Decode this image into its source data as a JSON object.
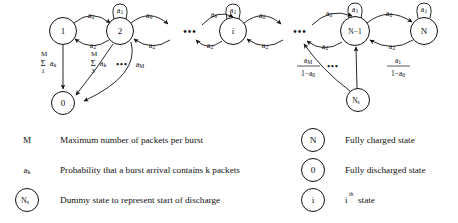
{
  "diagram": {
    "states": [
      {
        "id": "s1",
        "label": "1",
        "cx": 63,
        "cy": 31,
        "r": 13.5
      },
      {
        "id": "s2",
        "label": "2",
        "cx": 120,
        "cy": 31,
        "r": 13.5
      },
      {
        "id": "si",
        "label": "i",
        "cx": 233,
        "cy": 31,
        "r": 13.5
      },
      {
        "id": "sNm1",
        "label": "N−1",
        "cx": 355,
        "cy": 31,
        "r": 14.5
      },
      {
        "id": "sN",
        "label": "N",
        "cx": 424,
        "cy": 31,
        "r": 13.5
      },
      {
        "id": "s0",
        "label": "0",
        "cx": 63,
        "cy": 103,
        "r": 11.5
      },
      {
        "id": "sNs",
        "label": "Ns",
        "cx": 358,
        "cy": 100,
        "r": 11.5
      }
    ],
    "edge_labels": {
      "a0": "a",
      "a0_sub": "0",
      "a1": "a",
      "a1_sub": "1",
      "a2": "a",
      "a2_sub": "2",
      "aM": "a",
      "aM_sub": "M",
      "ak": "a",
      "ak_sub": "k",
      "sum_upper": "M",
      "sum_symbol": "Σ",
      "sum_lower_1": "1",
      "sum_lower_3": "3",
      "one_minus": "1−a",
      "one_minus_sub": "0"
    },
    "ellipses": [
      "•••",
      "•••",
      "•••",
      "•••"
    ],
    "transitions": [
      {
        "from": "1",
        "to": "2",
        "label": "a0"
      },
      {
        "from": "2",
        "to": "1",
        "label": "a2"
      },
      {
        "from": "2",
        "to": "2",
        "label": "a1"
      },
      {
        "from": "2",
        "to": "next",
        "label": "a0"
      },
      {
        "from": "next",
        "to": "2",
        "label": "a2"
      },
      {
        "from": "prev",
        "to": "i",
        "label": "a0"
      },
      {
        "from": "i",
        "to": "prev",
        "label": "a2"
      },
      {
        "from": "i",
        "to": "i",
        "label": "a1"
      },
      {
        "from": "i",
        "to": "next2",
        "label": "a0"
      },
      {
        "from": "next2",
        "to": "i",
        "label": "a2"
      },
      {
        "from": "prev2",
        "to": "N-1",
        "label": "a0"
      },
      {
        "from": "N-1",
        "to": "prev2",
        "label": "a2"
      },
      {
        "from": "N-1",
        "to": "N-1",
        "label": "a1"
      },
      {
        "from": "N-1",
        "to": "N",
        "label": "a0"
      },
      {
        "from": "N",
        "to": "N-1",
        "label": "a2"
      },
      {
        "from": "N",
        "to": "N",
        "label": "a1"
      },
      {
        "from": "1",
        "to": "0",
        "label": "sum_M_1_ak"
      },
      {
        "from": "2",
        "to": "0",
        "label": "sum_M_3_ak"
      },
      {
        "from": "2",
        "to": "0",
        "label": "aM"
      },
      {
        "from": "Ns",
        "to": "N-1",
        "label": "a1_over_1_minus_a0"
      },
      {
        "from": "Ns",
        "to": "mid",
        "label": "aM_over_1_minus_a0"
      }
    ]
  },
  "legend": {
    "left": [
      {
        "key": "M",
        "key_sub": "",
        "key_type": "text",
        "desc": "Maximum number of packets per burst"
      },
      {
        "key": "a",
        "key_sub": "k",
        "key_type": "text",
        "desc": "Probability that a burst arrival contains k packets"
      },
      {
        "key": "N",
        "key_sub": "s",
        "key_type": "circle",
        "desc": "Dummy state to represent start of discharge"
      }
    ],
    "right": [
      {
        "key": "N",
        "key_sub": "",
        "key_type": "circle",
        "desc": "Fully charged state"
      },
      {
        "key": "0",
        "key_sub": "",
        "key_type": "circle",
        "desc": "Fully discharged state"
      },
      {
        "key": "i",
        "key_sub": "",
        "key_type": "circle",
        "desc": "i",
        "desc_sup": "th",
        "desc_tail": "state"
      }
    ]
  },
  "colors": {
    "stroke": "#111111",
    "background": "#ffffff"
  }
}
